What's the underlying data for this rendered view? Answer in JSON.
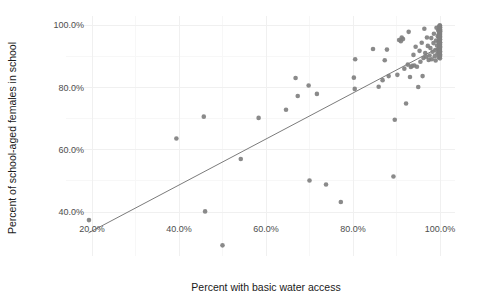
{
  "chart_data": {
    "type": "scatter",
    "title": "",
    "xlabel": "Percent with basic water access",
    "ylabel": "Percent of school-aged females in school",
    "xlim": [
      14.0,
      103.5
    ],
    "ylim": [
      26.0,
      103.0
    ],
    "grid": true,
    "legend": null,
    "point_color": "#808080",
    "line_color": "#595959",
    "background_color": "#ffffff",
    "gridline_color": "#f0f0f0",
    "xticks": [
      20,
      40,
      60,
      80,
      100
    ],
    "xtick_labels": [
      "20.0%",
      "40.0%",
      "60.0%",
      "80.0%",
      "100.0%"
    ],
    "yticks": [
      40,
      60,
      80,
      100
    ],
    "ytick_labels": [
      "40.0%",
      "60.0%",
      "80.0%",
      "100.0%"
    ],
    "series": [
      {
        "name": "countries",
        "marker": "circle",
        "points": [
          [
            19.3,
            37.4
          ],
          [
            39.4,
            63.6
          ],
          [
            45.7,
            70.6
          ],
          [
            46.0,
            40.2
          ],
          [
            50.0,
            29.3
          ],
          [
            54.2,
            57.0
          ],
          [
            58.3,
            70.2
          ],
          [
            64.6,
            72.8
          ],
          [
            66.8,
            83.0
          ],
          [
            67.3,
            77.2
          ],
          [
            69.8,
            80.6
          ],
          [
            70.0,
            50.1
          ],
          [
            71.7,
            77.9
          ],
          [
            73.8,
            48.8
          ],
          [
            77.2,
            43.2
          ],
          [
            80.2,
            83.1
          ],
          [
            80.4,
            79.5
          ],
          [
            80.5,
            89.0
          ],
          [
            84.6,
            92.3
          ],
          [
            85.9,
            80.2
          ],
          [
            86.8,
            82.3
          ],
          [
            87.3,
            88.7
          ],
          [
            87.8,
            92.1
          ],
          [
            88.2,
            83.6
          ],
          [
            89.3,
            51.4
          ],
          [
            89.6,
            69.6
          ],
          [
            90.2,
            84.0
          ],
          [
            90.6,
            95.2
          ],
          [
            91.0,
            94.8
          ],
          [
            91.2,
            96.0
          ],
          [
            91.5,
            95.5
          ],
          [
            91.8,
            86.0
          ],
          [
            92.2,
            74.8
          ],
          [
            92.6,
            87.3
          ],
          [
            92.8,
            97.8
          ],
          [
            93.1,
            83.3
          ],
          [
            93.3,
            86.5
          ],
          [
            93.6,
            86.9
          ],
          [
            93.9,
            90.4
          ],
          [
            94.1,
            87.0
          ],
          [
            94.4,
            93.0
          ],
          [
            94.7,
            86.6
          ],
          [
            95.0,
            80.1
          ],
          [
            95.3,
            91.7
          ],
          [
            95.5,
            88.2
          ],
          [
            95.8,
            94.3
          ],
          [
            96.0,
            83.6
          ],
          [
            96.2,
            89.4
          ],
          [
            96.4,
            98.8
          ],
          [
            96.6,
            91.0
          ],
          [
            96.8,
            89.8
          ],
          [
            97.0,
            96.0
          ],
          [
            97.2,
            93.3
          ],
          [
            97.4,
            88.8
          ],
          [
            97.6,
            90.2
          ],
          [
            97.8,
            92.6
          ],
          [
            98.0,
            95.8
          ],
          [
            98.1,
            89.0
          ],
          [
            98.3,
            91.4
          ],
          [
            98.5,
            94.2
          ],
          [
            98.6,
            97.2
          ],
          [
            98.8,
            90.0
          ],
          [
            98.9,
            92.0
          ],
          [
            99.0,
            88.6
          ],
          [
            99.1,
            95.0
          ],
          [
            99.2,
            99.1
          ],
          [
            99.3,
            93.4
          ],
          [
            99.4,
            90.8
          ],
          [
            99.5,
            96.4
          ],
          [
            99.55,
            92.3
          ],
          [
            99.6,
            98.2
          ],
          [
            99.65,
            94.6
          ],
          [
            99.7,
            91.2
          ],
          [
            99.72,
            97.0
          ],
          [
            99.75,
            89.6
          ],
          [
            99.78,
            93.8
          ],
          [
            99.8,
            96.1
          ],
          [
            99.82,
            99.6
          ],
          [
            99.84,
            91.9
          ],
          [
            99.86,
            94.9
          ],
          [
            99.88,
            97.6
          ],
          [
            99.9,
            90.4
          ],
          [
            99.91,
            93.1
          ],
          [
            99.92,
            95.6
          ],
          [
            99.93,
            98.5
          ],
          [
            99.94,
            92.7
          ],
          [
            99.95,
            96.8
          ],
          [
            99.955,
            99.9
          ],
          [
            99.96,
            91.0
          ],
          [
            99.965,
            94.0
          ],
          [
            99.97,
            97.3
          ],
          [
            99.975,
            89.9
          ],
          [
            99.98,
            92.4
          ],
          [
            99.982,
            95.2
          ],
          [
            99.984,
            98.0
          ],
          [
            99.986,
            93.6
          ],
          [
            99.988,
            96.5
          ],
          [
            99.99,
            99.3
          ],
          [
            99.991,
            90.6
          ],
          [
            99.992,
            94.5
          ],
          [
            99.993,
            97.9
          ],
          [
            99.994,
            92.0
          ],
          [
            99.995,
            95.9
          ],
          [
            99.996,
            99.0
          ],
          [
            99.997,
            91.5
          ],
          [
            99.998,
            93.9
          ],
          [
            99.9985,
            96.2
          ],
          [
            99.999,
            98.6
          ],
          [
            100.0,
            90.2
          ],
          [
            100.0,
            92.8
          ],
          [
            100.0,
            94.4
          ],
          [
            100.0,
            96.9
          ],
          [
            100.0,
            98.3
          ],
          [
            100.0,
            99.7
          ],
          [
            100.0,
            91.3
          ],
          [
            100.0,
            93.2
          ],
          [
            100.0,
            95.4
          ],
          [
            100.0,
            97.5
          ],
          [
            100.0,
            89.3
          ]
        ]
      }
    ],
    "trend_line": {
      "name": "linear-fit",
      "x_start": 19.2,
      "y_start": 33.3,
      "x_end": 99.8,
      "y_end": 92.8
    }
  }
}
